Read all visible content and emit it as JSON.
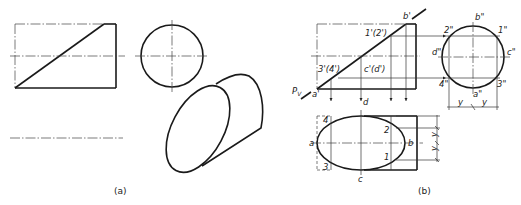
{
  "figure": {
    "caption_a": "(a)",
    "caption_b": "(b)"
  },
  "part_b_labels": {
    "b_prime": "b'",
    "a_prime": "a'",
    "pv": "P",
    "pv_sub": "V",
    "p1_2_front": "1'(2')",
    "p3_4_front": "3'(4')",
    "c_d_front": "c'(d')",
    "side_b": "b\"",
    "side_a": "a\"",
    "side_c": "c\"",
    "side_d": "d\"",
    "side_1": "1\"",
    "side_2": "2\"",
    "side_3": "3\"",
    "side_4": "4\"",
    "dim_y1": "y",
    "dim_y2": "y",
    "top_a": "a",
    "top_b": "b",
    "top_c": "c",
    "top_d": "d",
    "top_1": "1",
    "top_2": "2",
    "top_3": "3",
    "top_4": "4",
    "top_dim_y1": "y",
    "top_dim_y2": "y"
  },
  "colors": {
    "line": "#1a1a1a",
    "background": "#ffffff"
  }
}
